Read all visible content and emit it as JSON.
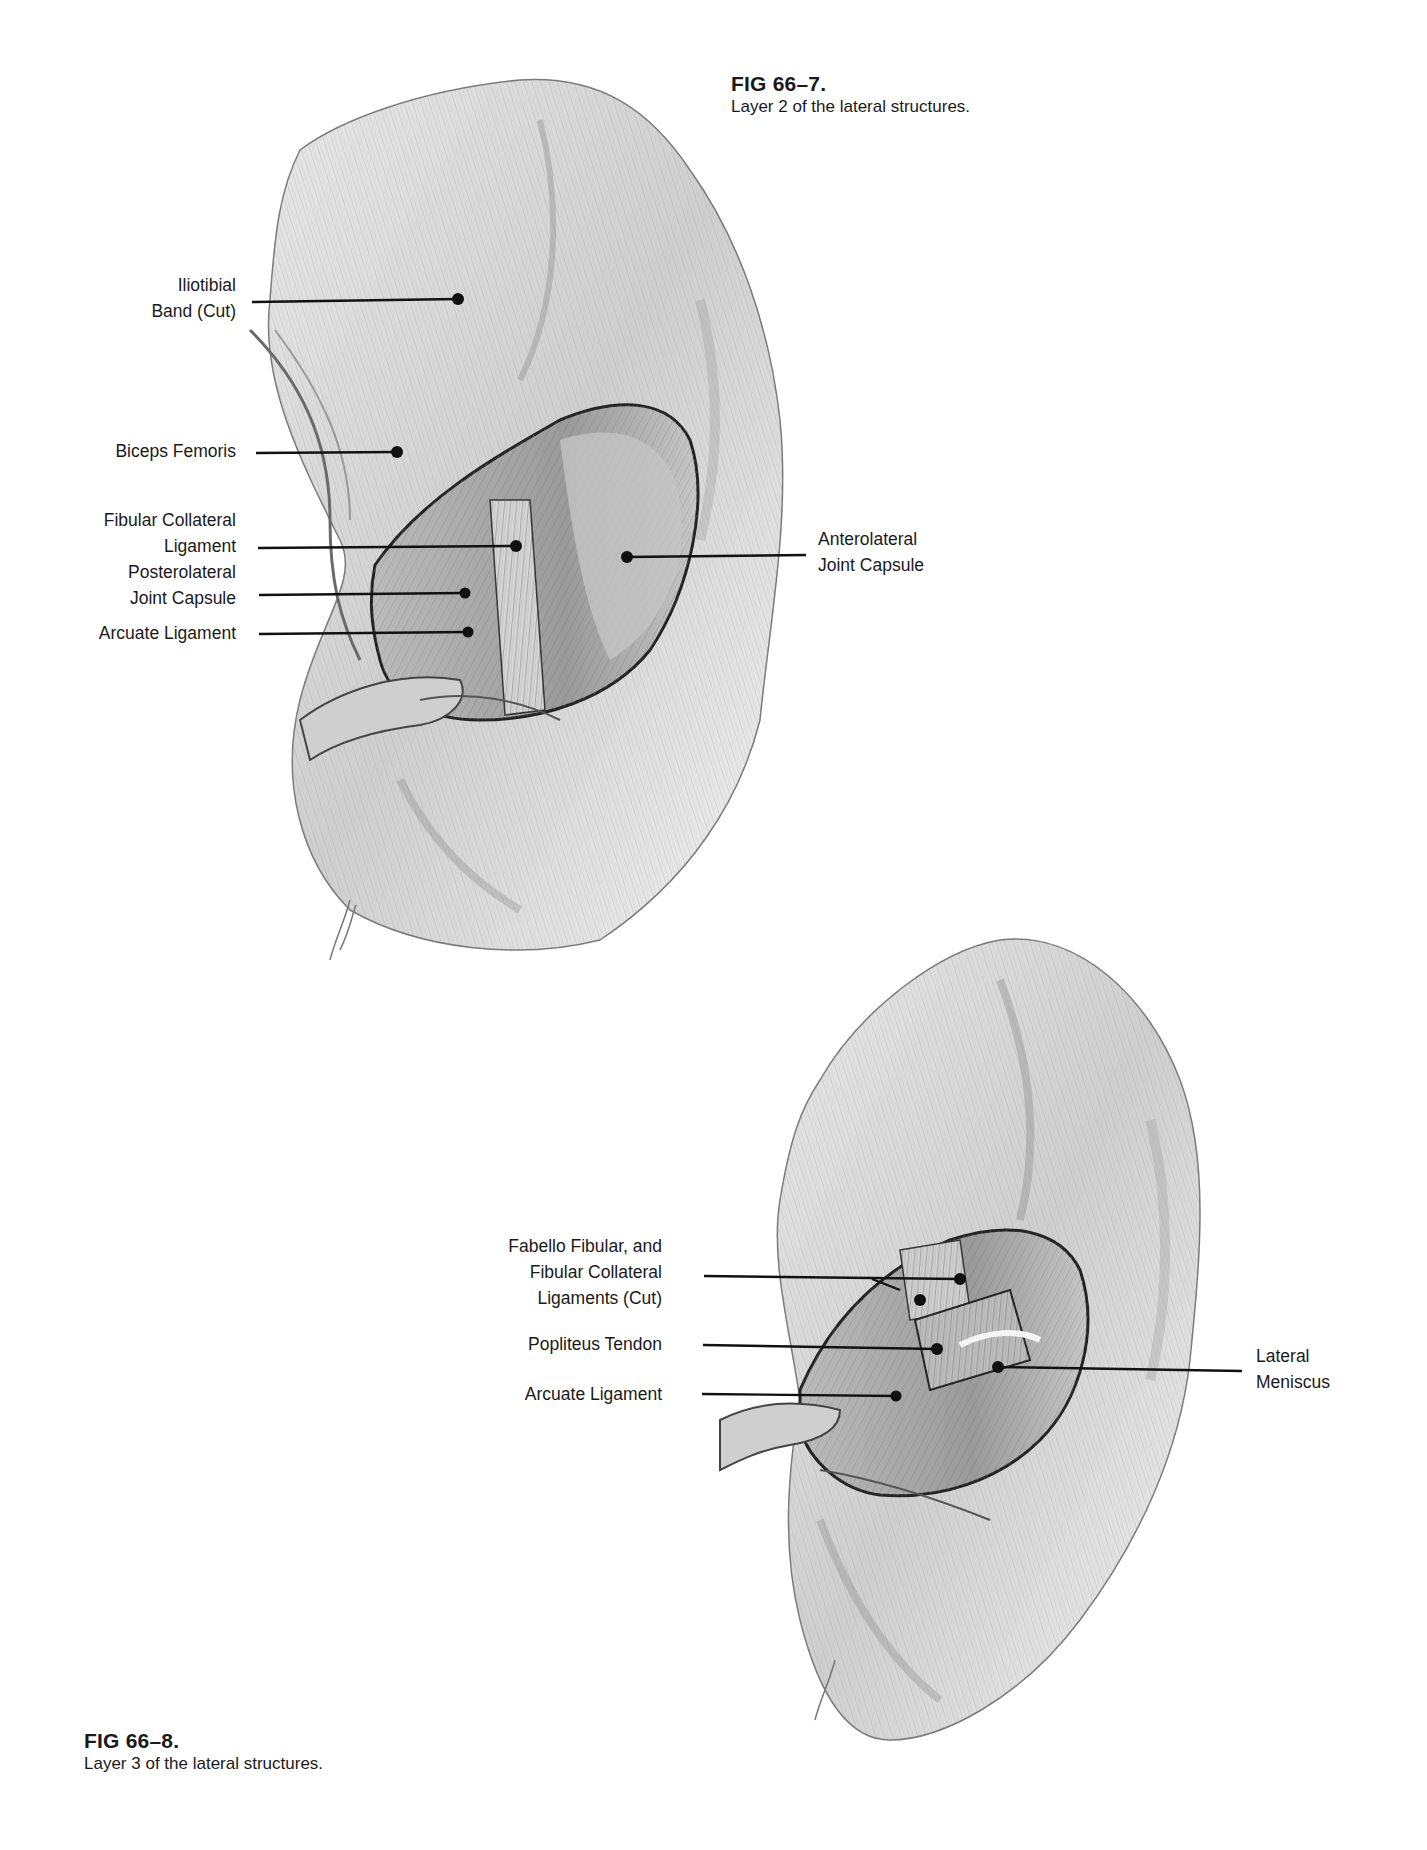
{
  "page": {
    "type": "textbook page with anatomical illustrations"
  },
  "figures": [
    {
      "number": "FIG 66–7.",
      "caption": "Layer 2 of the lateral structures.",
      "labels": [
        {
          "id": "iliotibial",
          "lines": [
            "Iliotibial",
            "Band (Cut)"
          ]
        },
        {
          "id": "biceps",
          "lines": [
            "Biceps Femoris"
          ]
        },
        {
          "id": "fcl",
          "lines": [
            "Fibular Collateral",
            "Ligament"
          ]
        },
        {
          "id": "plc",
          "lines": [
            "Posterolateral",
            "Joint Capsule"
          ]
        },
        {
          "id": "arcuate",
          "lines": [
            "Arcuate Ligament"
          ]
        },
        {
          "id": "alc",
          "lines": [
            "Anterolateral",
            "Joint Capsule"
          ]
        }
      ]
    },
    {
      "number": "FIG 66–8.",
      "caption": "Layer 3 of the lateral structures.",
      "labels": [
        {
          "id": "fabello",
          "lines": [
            "Fabello Fibular, and",
            "Fibular Collateral",
            "Ligaments (Cut)"
          ]
        },
        {
          "id": "popliteus",
          "lines": [
            "Popliteus Tendon"
          ]
        },
        {
          "id": "arcuate2",
          "lines": [
            "Arcuate Ligament"
          ]
        },
        {
          "id": "meniscus",
          "lines": [
            "Lateral",
            "Meniscus"
          ]
        }
      ]
    }
  ]
}
